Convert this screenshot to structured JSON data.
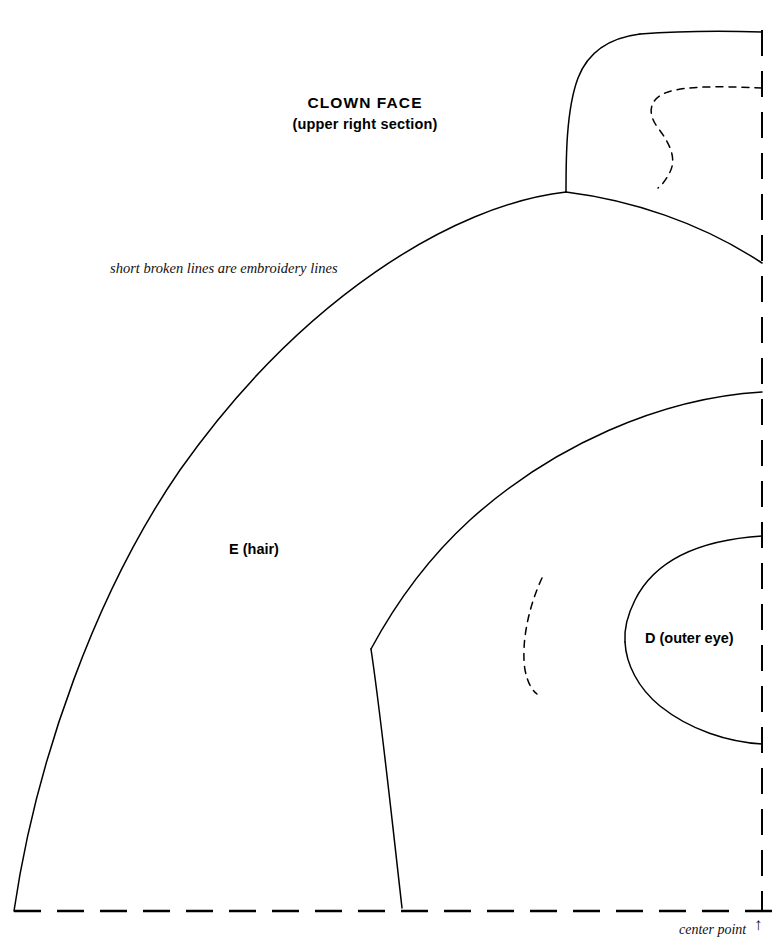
{
  "title": {
    "main": "CLOWN FACE",
    "sub": "(upper right section)"
  },
  "notes": {
    "embroidery": "short broken lines are embroidery lines",
    "center_point": "center point",
    "center_point_arrow": "↑"
  },
  "pieces": [
    {
      "id": "E",
      "label": "E (hair)"
    },
    {
      "id": "D",
      "label": "D (outer eye)"
    }
  ],
  "labels": {
    "piece_e": "E (hair)",
    "piece_d": "D (outer eye)"
  },
  "colors": {
    "ink": "#000000",
    "paper": "#ffffff"
  },
  "drawing": {
    "type": "sewing-pattern",
    "units": "px",
    "width": 772,
    "height": 951,
    "center_point": {
      "x": 762,
      "y": 911
    },
    "fold_lines": [
      {
        "name": "vertical-center-fold",
        "orientation": "vertical",
        "x": 762,
        "y1": 30,
        "y2": 911,
        "style": "dashed"
      },
      {
        "name": "horizontal-base-fold",
        "orientation": "horizontal",
        "y": 911,
        "x1": 14,
        "x2": 772,
        "style": "dashed"
      }
    ],
    "cut_lines": [
      {
        "name": "hair-outer-arc",
        "style": "solid",
        "path": "M 566 192 C 452 205 300 300 180 470 C 96 592 36 760 14 911"
      },
      {
        "name": "hat-tuft-left-edge",
        "style": "solid",
        "path": "M 566 192 C 566 160 566 110 578 78 C 588 52 608 38 640 34"
      },
      {
        "name": "hat-tuft-top-edge",
        "style": "solid",
        "path": "M 640 34 C 680 31 730 31 762 32"
      },
      {
        "name": "hairline-upper-right",
        "style": "solid",
        "path": "M 566 192 C 630 200 700 222 762 263"
      },
      {
        "name": "hairline-inner-arc",
        "style": "solid",
        "path": "M 762 392 C 660 398 552 446 470 520 C 424 562 392 610 371 649"
      },
      {
        "name": "hair-inner-lower-edge",
        "style": "solid",
        "path": "M 371 649 C 381 716 392 820 402 908"
      },
      {
        "name": "outer-eye-upper",
        "style": "solid",
        "path": "M 762 536 C 700 540 655 560 635 600 C 627 616 624 630 625 642"
      },
      {
        "name": "outer-eye-lower",
        "style": "solid",
        "path": "M 625 642 C 626 664 638 688 660 706 C 690 730 728 742 762 744"
      }
    ],
    "embroidery_lines": [
      {
        "name": "hat-tuft-embroidery-s-curve",
        "style": "dashed",
        "path": "M 762 88 C 720 86 686 86 668 92 C 650 98 646 112 658 128 C 672 146 676 160 670 172 C 666 180 662 185 658 188"
      },
      {
        "name": "cheek-embroidery-arc",
        "style": "dashed",
        "path": "M 542 578 C 528 608 521 644 525 670 C 528 684 532 690 537 694"
      }
    ]
  }
}
